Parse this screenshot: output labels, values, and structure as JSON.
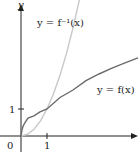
{
  "diagram": {
    "axes": {
      "x_label": "x",
      "y_label": "y",
      "origin_label": "0",
      "x_tick_label": "1",
      "y_tick_label": "1"
    },
    "curves": [
      {
        "name": "f",
        "label": "y = f(x)",
        "color": "#6b6b6b"
      },
      {
        "name": "f_inverse",
        "label": "y = f⁻¹(x)",
        "color": "#c4c4c4"
      }
    ],
    "intersection": [
      1,
      1
    ]
  }
}
